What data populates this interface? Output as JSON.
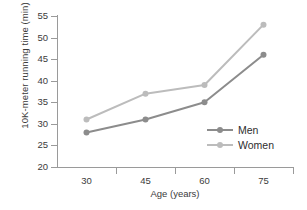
{
  "chart_data": {
    "type": "line",
    "title": "",
    "xlabel": "Age (years)",
    "ylabel": "10K-meter running time (min)",
    "categories": [
      "30",
      "45",
      "60",
      "75"
    ],
    "yticks": [
      "55",
      "50",
      "45",
      "40",
      "35",
      "30",
      "25",
      "20"
    ],
    "ylim": [
      20,
      55
    ],
    "grid": false,
    "legend_position": "inside lower-right",
    "series": [
      {
        "name": "Men",
        "color": "#8c8c8c",
        "values": [
          28,
          31,
          35,
          46
        ]
      },
      {
        "name": "Women",
        "color": "#bcbcbc",
        "values": [
          31,
          37,
          39,
          53
        ]
      }
    ]
  },
  "axis": {
    "spine_color": "#9a9a9a",
    "text_color": "#3b3b3b"
  }
}
